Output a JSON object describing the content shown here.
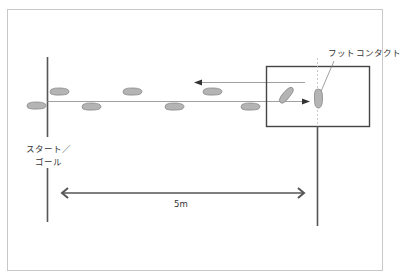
{
  "diagram": {
    "title": "",
    "labels": {
      "foot_contact": "フットコンタクト",
      "start_line1": "スタート／",
      "start_line2": "ゴール",
      "distance": "5m"
    },
    "colors": {
      "line": "#555555",
      "thin_line": "#777777",
      "foot_fill": "#b4b4b4",
      "foot_stroke": "#8a8a8a",
      "frame": "#c8c8c8",
      "dashed": "#bbbbbb"
    },
    "footprints": [
      {
        "id": "foot-1",
        "row": "bottom",
        "cx": 37,
        "cy": 106
      },
      {
        "id": "foot-2",
        "row": "top",
        "cx": 60,
        "cy": 92
      },
      {
        "id": "foot-3",
        "row": "bottom",
        "cx": 92,
        "cy": 107
      },
      {
        "id": "foot-4",
        "row": "top",
        "cx": 132,
        "cy": 92
      },
      {
        "id": "foot-5",
        "row": "bottom",
        "cx": 175,
        "cy": 107
      },
      {
        "id": "foot-6",
        "row": "top",
        "cx": 212,
        "cy": 92
      },
      {
        "id": "foot-7",
        "row": "bottom",
        "cx": 251,
        "cy": 107
      },
      {
        "id": "foot-8",
        "row": "turn",
        "cx": 287,
        "cy": 94
      },
      {
        "id": "foot-9",
        "row": "contact",
        "cx": 318,
        "cy": 99
      }
    ]
  }
}
